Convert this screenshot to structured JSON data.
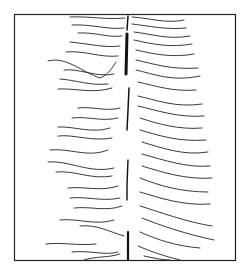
{
  "figure": {
    "stroke_color": "#1a1a1a",
    "background": "#ffffff"
  }
}
